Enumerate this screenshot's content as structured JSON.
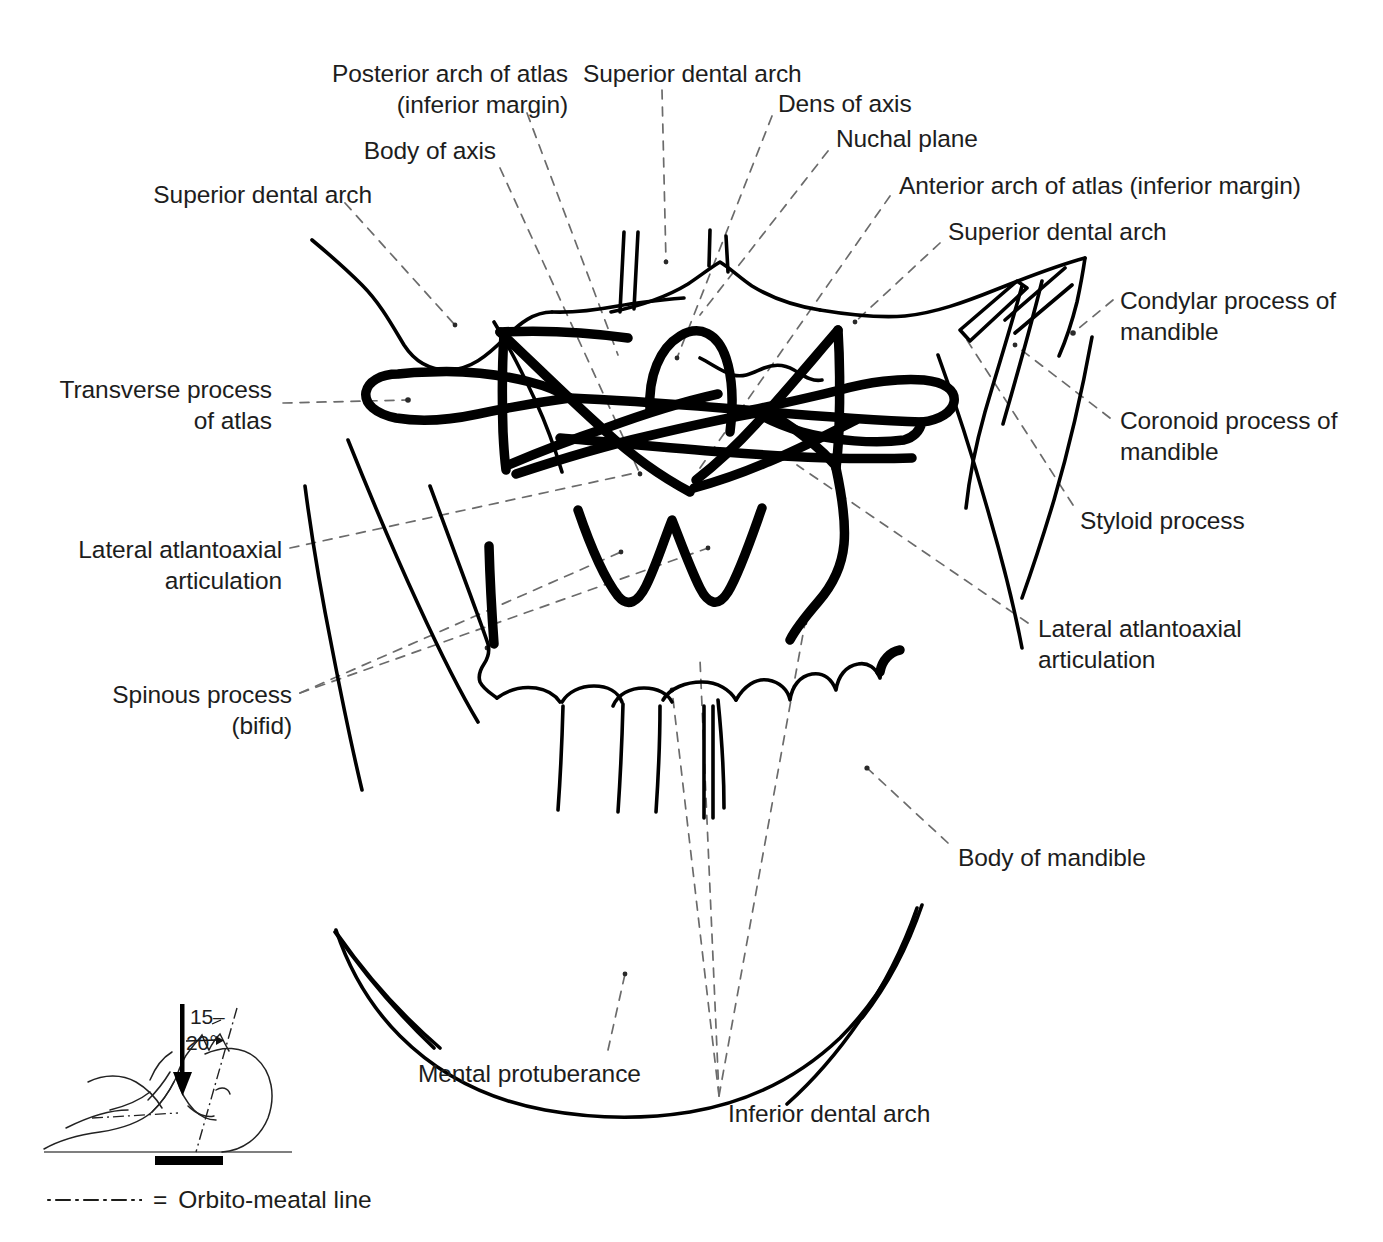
{
  "figure": {
    "kind": "radiographic-line-drawing",
    "region": "cervical spine, open-mouth (atlanto-axial) projection",
    "labels": [
      {
        "id": "superior-dental-arch-left",
        "text": "Superior dental arch"
      },
      {
        "id": "body-of-axis",
        "text": "Body of axis"
      },
      {
        "id": "posterior-arch-of-atlas",
        "text": "Posterior arch of atlas\n(inferior margin)"
      },
      {
        "id": "superior-dental-arch-top",
        "text": "Superior dental arch"
      },
      {
        "id": "dens-of-axis",
        "text": "Dens of axis"
      },
      {
        "id": "nuchal-plane",
        "text": "Nuchal plane"
      },
      {
        "id": "anterior-arch-of-atlas",
        "text": "Anterior arch of atlas (inferior margin)"
      },
      {
        "id": "superior-dental-arch-right",
        "text": "Superior dental arch"
      },
      {
        "id": "condylar-process",
        "text": "Condylar process of\nmandible"
      },
      {
        "id": "coronoid-process",
        "text": "Coronoid process of\nmandible"
      },
      {
        "id": "styloid-process",
        "text": "Styloid process"
      },
      {
        "id": "lateral-atlantoaxial-right",
        "text": "Lateral atlantoaxial\narticulation"
      },
      {
        "id": "body-of-mandible",
        "text": "Body of mandible"
      },
      {
        "id": "transverse-process",
        "text": "Transverse process\nof atlas"
      },
      {
        "id": "lateral-atlantoaxial-left",
        "text": "Lateral atlantoaxial\narticulation"
      },
      {
        "id": "spinous-process",
        "text": "Spinous process\n(bifid)"
      },
      {
        "id": "mental-protuberance",
        "text": "Mental protuberance"
      },
      {
        "id": "inferior-dental-arch",
        "text": "Inferior dental arch"
      }
    ]
  },
  "positioning_diagram": {
    "angle_top": "15",
    "angle_top_dash": "–",
    "angle_bottom": "20°",
    "description": "supine patient with central ray angled 15–20 degrees"
  },
  "legend": {
    "symbol": "·—·—·—·",
    "equals": "=",
    "text": "Orbito-meatal line"
  },
  "colors": {
    "ink": "#000000",
    "text": "#1d1d1d",
    "leader": "#6b6b6b"
  }
}
